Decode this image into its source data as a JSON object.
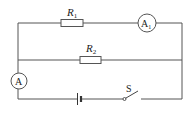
{
  "diagram": {
    "type": "circuit",
    "components": {
      "r1": {
        "label": "R",
        "sub": "1"
      },
      "r2": {
        "label": "R",
        "sub": "2"
      },
      "a1": {
        "label": "A",
        "sub": "1"
      },
      "a": {
        "label": "A"
      },
      "switch": {
        "label": "S"
      },
      "battery": {
        "label": ""
      }
    }
  }
}
